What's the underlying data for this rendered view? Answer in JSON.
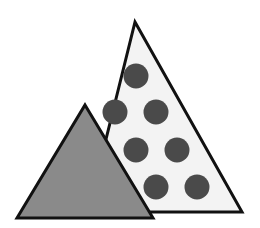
{
  "diagram": {
    "background": "#ffffff",
    "stroke_color": "#111111",
    "large_triangle": {
      "fill": "#f3f3f3",
      "points": "135,22 242,212 88,212"
    },
    "small_triangle": {
      "fill": "#8a8a8a",
      "points": "85,105 153,218 17,218"
    },
    "dot_color": "#4a4a4a",
    "dot_radius": 12.5,
    "dots": [
      {
        "cx": 136,
        "cy": 76
      },
      {
        "cx": 115,
        "cy": 112
      },
      {
        "cx": 156,
        "cy": 112
      },
      {
        "cx": 136,
        "cy": 150
      },
      {
        "cx": 177,
        "cy": 150
      },
      {
        "cx": 156,
        "cy": 187
      },
      {
        "cx": 197,
        "cy": 187
      }
    ]
  }
}
